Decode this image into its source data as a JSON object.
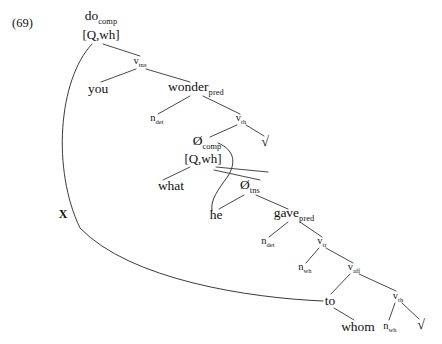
{
  "figure": {
    "number": "(69)",
    "type": "syntactic-tree",
    "sentence": "do you wonder what he gave to whom"
  },
  "nodes": [
    {
      "id": "do-comp",
      "text": "do",
      "sub": "comp",
      "x": 101,
      "y": 18,
      "style": "lex"
    },
    {
      "id": "q-wh-top",
      "text": "[Q,wh]",
      "sub": "",
      "x": 101,
      "y": 34,
      "style": "feat"
    },
    {
      "id": "v-tns-top",
      "text": "v",
      "sub": "tns",
      "x": 140,
      "y": 62,
      "style": "cat"
    },
    {
      "id": "you",
      "text": "you",
      "sub": "",
      "x": 98,
      "y": 89,
      "style": "lex"
    },
    {
      "id": "wonder",
      "text": "wonder",
      "sub": "pred",
      "x": 196,
      "y": 89,
      "style": "lex"
    },
    {
      "id": "n-det-1",
      "text": "n",
      "sub": "det",
      "x": 157,
      "y": 119,
      "style": "cat"
    },
    {
      "id": "v-th-1",
      "text": "v",
      "sub": "th",
      "x": 241,
      "y": 119,
      "style": "cat"
    },
    {
      "id": "null-comp",
      "text": "Ø",
      "sub": "comp",
      "x": 207,
      "y": 143,
      "style": "lex"
    },
    {
      "id": "q-wh-emb",
      "text": "[Q,wh]",
      "sub": "",
      "x": 203,
      "y": 158,
      "style": "feat"
    },
    {
      "id": "root-1",
      "text": "√",
      "sub": "",
      "x": 265,
      "y": 142,
      "style": "root-sym"
    },
    {
      "id": "what",
      "text": "what",
      "sub": "",
      "x": 171,
      "y": 186,
      "style": "lex"
    },
    {
      "id": "null-tns",
      "text": "Ø",
      "sub": "tns",
      "x": 250,
      "y": 187,
      "style": "lex"
    },
    {
      "id": "he",
      "text": "he",
      "sub": "",
      "x": 216,
      "y": 215,
      "style": "lex"
    },
    {
      "id": "gave",
      "text": "gave",
      "sub": "pred",
      "x": 294,
      "y": 215,
      "style": "lex"
    },
    {
      "id": "n-det-2",
      "text": "n",
      "sub": "det",
      "x": 268,
      "y": 242,
      "style": "cat"
    },
    {
      "id": "v-tr",
      "text": "v",
      "sub": "tr",
      "x": 322,
      "y": 242,
      "style": "cat"
    },
    {
      "id": "n-wh-1",
      "text": "n",
      "sub": "wh",
      "x": 305,
      "y": 268,
      "style": "cat"
    },
    {
      "id": "v-aff",
      "text": "v",
      "sub": "aff",
      "x": 354,
      "y": 268,
      "style": "cat"
    },
    {
      "id": "to",
      "text": "to",
      "sub": "",
      "x": 330,
      "y": 301,
      "style": "lex"
    },
    {
      "id": "v-th-2",
      "text": "v",
      "sub": "th",
      "x": 398,
      "y": 297,
      "style": "cat"
    },
    {
      "id": "whom",
      "text": "whom",
      "sub": "",
      "x": 358,
      "y": 327,
      "style": "lex"
    },
    {
      "id": "n-wh-2",
      "text": "n",
      "sub": "wh",
      "x": 390,
      "y": 327,
      "style": "cat"
    },
    {
      "id": "root-2",
      "text": "√",
      "sub": "",
      "x": 421,
      "y": 325,
      "style": "root-sym"
    }
  ],
  "edges": [
    {
      "id": "e-do-vtns",
      "from": "do-comp",
      "to": "v-tns-top",
      "d": "M 103 44 L 140 56"
    },
    {
      "id": "e-vtns-you",
      "from": "v-tns-top",
      "to": "you",
      "d": "M 136 69 L 101 82"
    },
    {
      "id": "e-vtns-wonder",
      "from": "v-tns-top",
      "to": "wonder",
      "d": "M 146 69 L 190 82"
    },
    {
      "id": "e-wonder-ndet",
      "from": "wonder",
      "to": "n-det-1",
      "d": "M 190 96 L 158 114"
    },
    {
      "id": "e-wonder-vth",
      "from": "wonder",
      "to": "v-th-1",
      "d": "M 203 96 L 240 114"
    },
    {
      "id": "e-vth-nullcomp",
      "from": "v-th-1",
      "to": "null-comp",
      "d": "M 237 125 L 210 137"
    },
    {
      "id": "e-vth-root",
      "from": "v-th-1",
      "to": "root-1",
      "d": "M 246 125 L 264 136"
    },
    {
      "id": "e-nullcomp-what",
      "from": "q-wh-emb",
      "to": "what",
      "d": "M 190 167 L 163 180"
    },
    {
      "id": "e-nullcomp-right",
      "from": "q-wh-emb",
      "to": "null-tns",
      "d": "M 216 167 L 268 172"
    },
    {
      "id": "e-bar-cross",
      "from": "q-wh-emb",
      "to": "null-tns",
      "d": "M 214 170 L 260 180"
    },
    {
      "id": "e-nulltns-he",
      "from": "null-tns",
      "to": "he",
      "d": "M 244 195 L 219 209"
    },
    {
      "id": "e-nulltns-gave",
      "from": "null-tns",
      "to": "gave",
      "d": "M 256 195 L 288 209"
    },
    {
      "id": "e-gave-ndet2",
      "from": "gave",
      "to": "n-det-2",
      "d": "M 288 222 L 269 237"
    },
    {
      "id": "e-gave-vtr",
      "from": "gave",
      "to": "v-tr",
      "d": "M 300 222 L 322 237"
    },
    {
      "id": "e-vtr-nwh",
      "from": "v-tr",
      "to": "n-wh-1",
      "d": "M 319 248 L 306 263"
    },
    {
      "id": "e-vtr-vaff",
      "from": "v-tr",
      "to": "v-aff",
      "d": "M 326 248 L 353 263"
    },
    {
      "id": "e-vaff-to",
      "from": "v-aff",
      "to": "to",
      "d": "M 350 274 L 331 294"
    },
    {
      "id": "e-vaff-vth2",
      "from": "v-aff",
      "to": "v-th-2",
      "d": "M 359 274 L 396 291"
    },
    {
      "id": "e-to-whom",
      "from": "to",
      "to": "whom",
      "d": "M 334 308 L 354 320"
    },
    {
      "id": "e-vth2-nwh2",
      "from": "v-th-2",
      "to": "n-wh-2",
      "d": "M 395 303 L 389 320"
    },
    {
      "id": "e-vth2-root2",
      "from": "v-th-2",
      "to": "root-2",
      "d": "M 402 303 L 419 319"
    }
  ],
  "movement_arcs": [
    {
      "id": "arc-do-to",
      "label": "X",
      "label_x": 63,
      "label_y": 218,
      "from": "do-comp",
      "to": "to",
      "d": "M 92 44 C 58 80, 52 170, 80 228 C 130 280, 250 298, 323 301"
    },
    {
      "id": "arc-nullcomp-he",
      "label": "",
      "label_x": 0,
      "label_y": 0,
      "from": "null-comp",
      "to": "he",
      "d": "M 218 143 C 235 150, 236 163, 228 176 C 218 190, 210 200, 212 211"
    }
  ]
}
